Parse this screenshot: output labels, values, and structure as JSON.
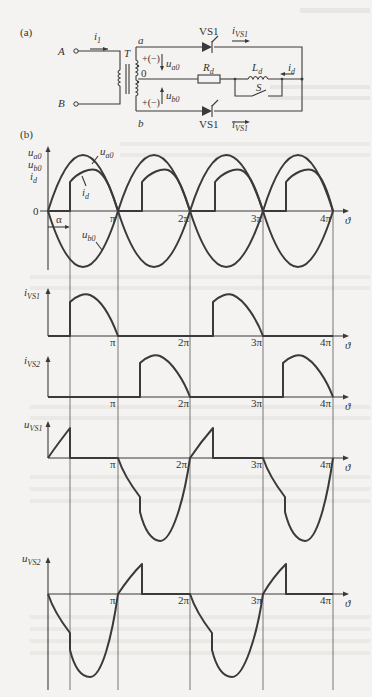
{
  "figure": {
    "panel_a_label": "(a)",
    "panel_b_label": "(b)",
    "circuit": {
      "terminals": [
        "A",
        "B"
      ],
      "primary_current": "i",
      "primary_current_sub": "1",
      "transformer_label": "T",
      "node_a": "a",
      "node_b": "b",
      "center_tap": "0",
      "polarity_top": "+(−)",
      "polarity_bottom": "+(−)",
      "voltage_top": "u",
      "voltage_top_sub": "a0",
      "voltage_bottom": "u",
      "voltage_bottom_sub": "b0",
      "thyristor_top": "VS1",
      "thyristor_bottom": "VS1",
      "thyristor_current_top": "i",
      "thyristor_current_top_sub": "VS1",
      "thyristor_current_bottom": "i",
      "thyristor_current_bottom_sub": "VS1",
      "resistor": "R",
      "resistor_sub": "d",
      "inductor": "L",
      "inductor_sub": "d",
      "switch": "S",
      "load_current": "i",
      "load_current_sub": "d"
    },
    "axes": {
      "x_var": "ϑ",
      "origin": "0",
      "alpha": "α",
      "ticks": [
        "π",
        "2π",
        "3π",
        "4π"
      ]
    },
    "waveform_labels": {
      "panel1_y": [
        "u",
        "u",
        "i"
      ],
      "panel1_y_sub": [
        "a0",
        "b0",
        "d"
      ],
      "ua0": "u",
      "ua0_sub": "a0",
      "ub0": "u",
      "ub0_sub": "b0",
      "id": "i",
      "id_sub": "d",
      "ivs1": "i",
      "ivs1_sub": "VS1",
      "ivs2": "i",
      "ivs2_sub": "VS2",
      "uvs1": "u",
      "uvs1_sub": "VS1",
      "uvs2": "u",
      "uvs2_sub": "VS2"
    }
  }
}
